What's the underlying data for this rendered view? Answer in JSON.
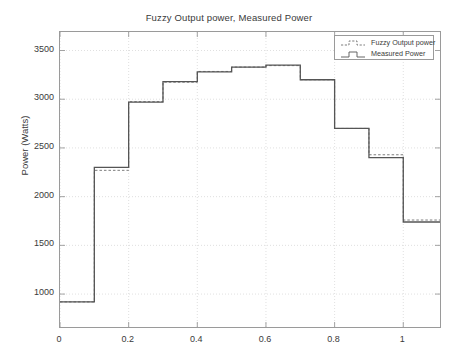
{
  "chart_data": {
    "type": "line",
    "title": "Fuzzy Output power, Measured Power",
    "xlabel": "",
    "ylabel": "Power (Watts)",
    "xlim": [
      0,
      1.107
    ],
    "ylim": [
      662,
      3690
    ],
    "xticks": [
      0,
      0.2,
      0.4,
      0.6,
      0.8,
      1
    ],
    "xticklabels": [
      "0",
      "0.2",
      "0.4",
      "0.6",
      "0.8",
      "1"
    ],
    "yticks": [
      1000,
      1500,
      2000,
      2500,
      3000,
      3500
    ],
    "yticklabels": [
      "1000",
      "1500",
      "2000",
      "2500",
      "3000",
      "3500"
    ],
    "grid": true,
    "drawstyle": "steps-post",
    "legend_position": "upper right",
    "legend": [
      "Fuzzy Output power",
      "Measured Power"
    ],
    "x": [
      0,
      0.1,
      0.2,
      0.3,
      0.4,
      0.5,
      0.6,
      0.7,
      0.8,
      0.9,
      1.0,
      1.107
    ],
    "series": [
      {
        "name": "Fuzzy Output power",
        "style": "dashed",
        "color": "#6e6e6e",
        "values": [
          920,
          2270,
          2975,
          3175,
          3285,
          3330,
          3345,
          3200,
          2700,
          2430,
          1760,
          1760
        ]
      },
      {
        "name": "Measured Power",
        "style": "solid",
        "color": "#555555",
        "values": [
          920,
          2300,
          2970,
          3180,
          3280,
          3330,
          3350,
          3200,
          2700,
          2400,
          1740,
          1740
        ]
      }
    ]
  },
  "colors": {
    "axis": "#9a9a9a",
    "grid": "#d8d8d8",
    "text": "#3a3a3a",
    "background": "#ffffff"
  }
}
